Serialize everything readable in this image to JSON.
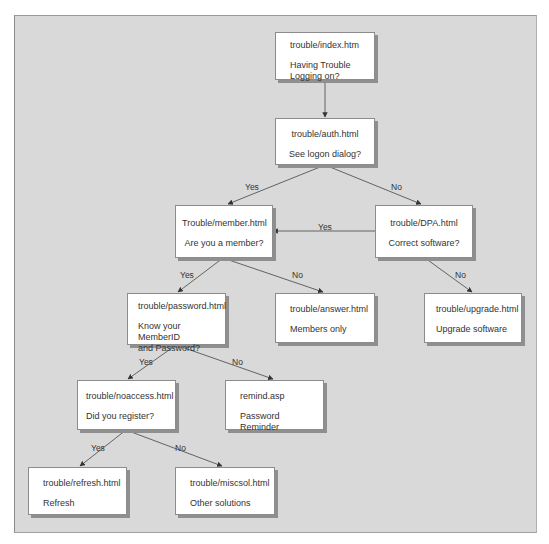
{
  "diagram": {
    "nodes": {
      "index": {
        "file": "trouble/index.htm",
        "desc": "Having Trouble\nLogging on?"
      },
      "auth": {
        "file": "trouble/auth.html",
        "desc": "See logon dialog?"
      },
      "member": {
        "file": "Trouble/member.html",
        "desc": "Are you a member?"
      },
      "dpa": {
        "file": "trouble/DPA.html",
        "desc": "Correct software?"
      },
      "password": {
        "file": "trouble/password.html",
        "desc": "Know your MemberID\nand Password?"
      },
      "answer": {
        "file": "trouble/answer.html",
        "desc": "Members only"
      },
      "upgrade": {
        "file": "trouble/upgrade.html",
        "desc": "Upgrade software"
      },
      "noaccess": {
        "file": "trouble/noaccess.html",
        "desc": "Did you register?"
      },
      "remind": {
        "file": "remind.asp",
        "desc": "Password Reminder"
      },
      "refresh": {
        "file": "trouble/refresh.html",
        "desc": "Refresh"
      },
      "miscsol": {
        "file": "trouble/miscsol.html",
        "desc": "Other solutions"
      }
    },
    "edges": [
      {
        "from": "index",
        "to": "auth",
        "label": ""
      },
      {
        "from": "auth",
        "to": "member",
        "label": "Yes"
      },
      {
        "from": "auth",
        "to": "dpa",
        "label": "No"
      },
      {
        "from": "dpa",
        "to": "member",
        "label": "Yes"
      },
      {
        "from": "dpa",
        "to": "upgrade",
        "label": "No"
      },
      {
        "from": "member",
        "to": "password",
        "label": "Yes"
      },
      {
        "from": "member",
        "to": "answer",
        "label": "No"
      },
      {
        "from": "password",
        "to": "noaccess",
        "label": "Yes"
      },
      {
        "from": "password",
        "to": "remind",
        "label": "No"
      },
      {
        "from": "noaccess",
        "to": "refresh",
        "label": "Yes"
      },
      {
        "from": "noaccess",
        "to": "miscsol",
        "label": "No"
      }
    ],
    "edge_labels": {
      "auth_member": "Yes",
      "auth_dpa": "No",
      "dpa_member": "Yes",
      "dpa_upgrade": "No",
      "member_password": "Yes",
      "member_answer": "No",
      "password_noaccess": "Yes",
      "password_remind": "No",
      "noaccess_refresh": "Yes",
      "noaccess_miscsol": "No"
    },
    "colors": {
      "background": "#d9d9d9",
      "node_fill": "#ffffff",
      "node_border": "#8c8c8c",
      "shadow": "#8f8f8f",
      "line": "#555555",
      "text": "#333333"
    }
  }
}
